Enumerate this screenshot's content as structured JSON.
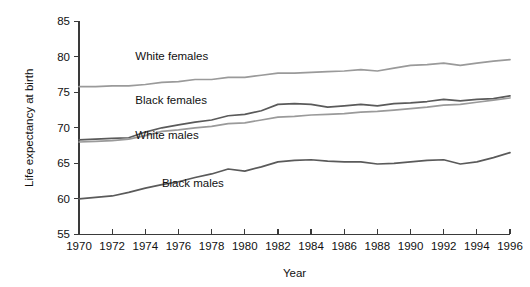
{
  "chart_data": {
    "type": "line",
    "title": "",
    "xlabel": "Year",
    "ylabel": "Life expectancy at birth",
    "xlim": [
      1970,
      1996
    ],
    "ylim": [
      55,
      85
    ],
    "grid": false,
    "legend_position": "inline-annotations",
    "x": [
      1970,
      1971,
      1972,
      1973,
      1974,
      1975,
      1976,
      1977,
      1978,
      1979,
      1980,
      1981,
      1982,
      1983,
      1984,
      1985,
      1986,
      1987,
      1988,
      1989,
      1990,
      1991,
      1992,
      1993,
      1994,
      1995,
      1996
    ],
    "x_tick_labels": [
      "1970",
      "1972",
      "1974",
      "1976",
      "1978",
      "1980",
      "1982",
      "1984",
      "1986",
      "1988",
      "1990",
      "1992",
      "1994",
      "1996"
    ],
    "x_ticks": [
      1970,
      1972,
      1974,
      1976,
      1978,
      1980,
      1982,
      1984,
      1986,
      1988,
      1990,
      1992,
      1994,
      1996
    ],
    "y_tick_labels": [
      "55",
      "60",
      "65",
      "70",
      "75",
      "80",
      "85"
    ],
    "y_ticks": [
      55,
      60,
      65,
      70,
      75,
      80,
      85
    ],
    "series": [
      {
        "name": "White females",
        "color": "#9a9a9a",
        "label_x": 1973.4,
        "label_y": 79.6,
        "values": [
          75.8,
          75.8,
          75.9,
          75.9,
          76.1,
          76.4,
          76.5,
          76.8,
          76.8,
          77.1,
          77.1,
          77.4,
          77.7,
          77.7,
          77.8,
          77.9,
          78.0,
          78.2,
          78.0,
          78.4,
          78.8,
          78.9,
          79.1,
          78.8,
          79.1,
          79.4,
          79.6
        ]
      },
      {
        "name": "Black females",
        "color": "#5a5a5a",
        "label_x": 1973.4,
        "label_y": 73.4,
        "values": [
          68.3,
          68.4,
          68.5,
          68.6,
          69.4,
          70.0,
          70.4,
          70.8,
          71.1,
          71.7,
          71.9,
          72.4,
          73.3,
          73.4,
          73.3,
          72.9,
          73.1,
          73.3,
          73.1,
          73.4,
          73.5,
          73.7,
          74.0,
          73.8,
          74.0,
          74.1,
          74.5
        ]
      },
      {
        "name": "White males",
        "color": "#9a9a9a",
        "label_x": 1973.4,
        "label_y": 68.4,
        "values": [
          68.0,
          68.1,
          68.2,
          68.4,
          68.9,
          69.5,
          69.7,
          70.0,
          70.2,
          70.6,
          70.7,
          71.1,
          71.5,
          71.6,
          71.8,
          71.9,
          72.0,
          72.2,
          72.3,
          72.5,
          72.7,
          72.9,
          73.2,
          73.3,
          73.6,
          73.9,
          74.2
        ]
      },
      {
        "name": "Black males",
        "color": "#5a5a5a",
        "label_x": 1975.0,
        "label_y": 61.7,
        "values": [
          60.0,
          60.2,
          60.4,
          60.9,
          61.5,
          62.0,
          62.4,
          63.0,
          63.5,
          64.2,
          63.9,
          64.5,
          65.2,
          65.4,
          65.5,
          65.3,
          65.2,
          65.2,
          64.9,
          65.0,
          65.2,
          65.4,
          65.5,
          64.9,
          65.2,
          65.8,
          66.5
        ]
      }
    ]
  }
}
